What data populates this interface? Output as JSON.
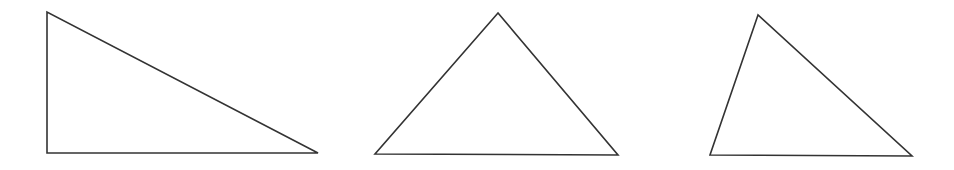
{
  "canvas": {
    "width": 954,
    "height": 170,
    "background": "#ffffff",
    "stroke_color": "#333333",
    "stroke_width": 1.6
  },
  "triangles": [
    {
      "id": "triangle-1",
      "kind": "right",
      "vertices": [
        [
          47,
          12
        ],
        [
          47,
          153
        ],
        [
          318,
          153
        ]
      ],
      "points": "47,12 47,153 318,153"
    },
    {
      "id": "triangle-2",
      "kind": "obtuse",
      "vertices": [
        [
          498,
          13
        ],
        [
          375,
          154
        ],
        [
          618,
          155
        ]
      ],
      "points": "498,13 375,154 618,155"
    },
    {
      "id": "triangle-3",
      "kind": "acute",
      "vertices": [
        [
          758,
          15
        ],
        [
          710,
          155
        ],
        [
          912,
          156
        ]
      ],
      "points": "758,15 710,155 912,156"
    }
  ]
}
